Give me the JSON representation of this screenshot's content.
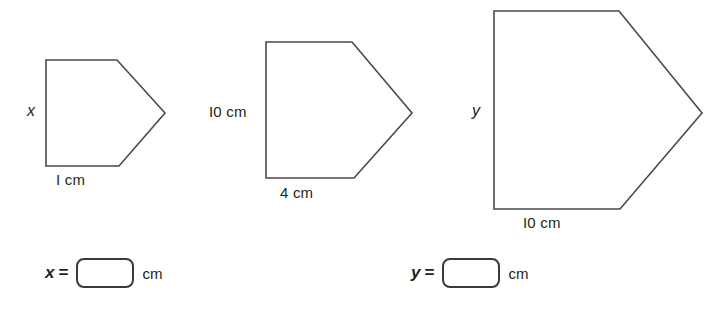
{
  "page": {
    "background_color": "#ffffff",
    "line_color": "#4a4a4a",
    "text_color": "#231f20"
  },
  "figures": [
    {
      "id": "shape-1",
      "name": "small-pentagon",
      "side_label": "x",
      "base_label": "I cm",
      "points": "46,60 117,60 165,113 119,166 46,166"
    },
    {
      "id": "shape-2",
      "name": "medium-pentagon",
      "side_label": "I0 cm",
      "base_label": "4 cm",
      "points": "266,42 352,42 412,113 354,178 266,178"
    },
    {
      "id": "shape-3",
      "name": "large-pentagon",
      "side_label": "y",
      "base_label": "I0 cm",
      "points": "494,11 619,11 702,113 620,209 494,209"
    }
  ],
  "answers": [
    {
      "id": "answer-x",
      "variable": "x",
      "equals": "=",
      "value": "",
      "unit": "cm"
    },
    {
      "id": "answer-y",
      "variable": "y",
      "equals": "=",
      "value": "",
      "unit": "cm"
    }
  ]
}
